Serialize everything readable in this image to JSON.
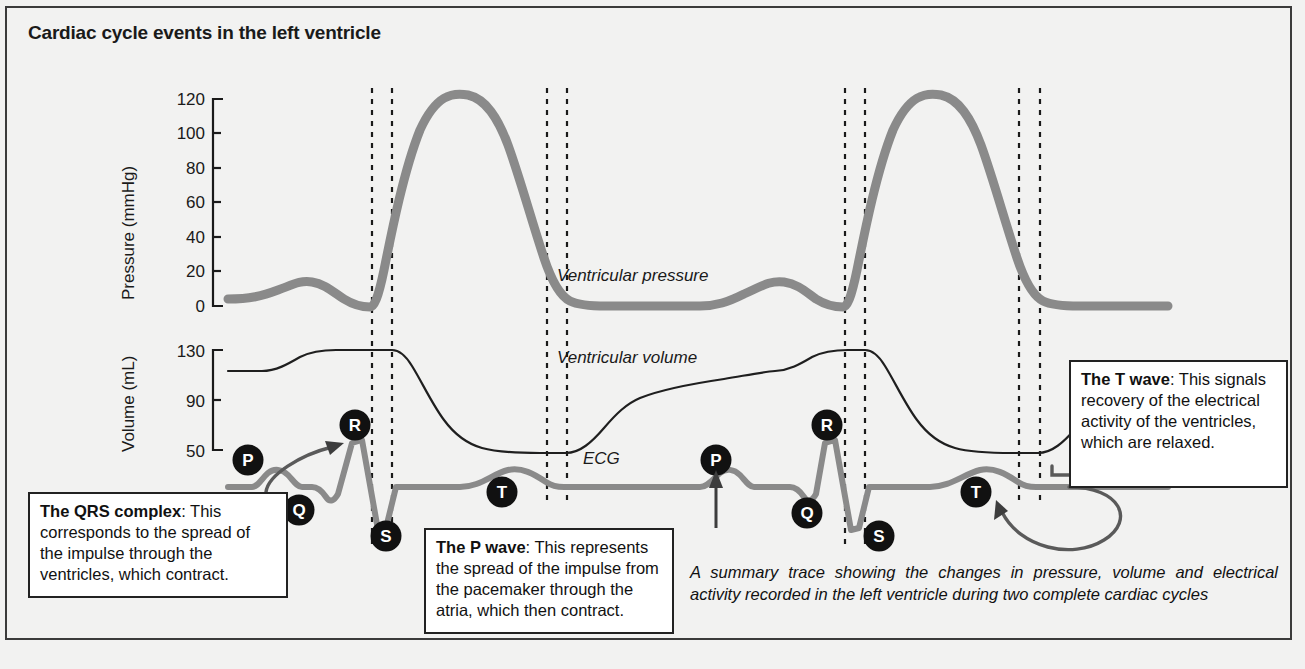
{
  "title": "Cardiac cycle events in the left ventricle",
  "axes": {
    "pressure": {
      "label": "Pressure  (mmHg)",
      "ticks": [
        "120",
        "100",
        "80",
        "60",
        "40",
        "20",
        "0"
      ],
      "unit": "mmHg",
      "min": 0,
      "max": 120
    },
    "volume": {
      "label": "Volume (mL)",
      "ticks": [
        "130",
        "90",
        "50"
      ],
      "unit": "mL",
      "min": 50,
      "max": 130
    }
  },
  "trace_labels": {
    "pressure": "Ventricular pressure",
    "volume": "Ventricular volume",
    "ecg": "ECG"
  },
  "ecg_markers": [
    {
      "letter": "P",
      "cx": 248,
      "cy": 460
    },
    {
      "letter": "Q",
      "cx": 299,
      "cy": 510
    },
    {
      "letter": "R",
      "cx": 355,
      "cy": 425
    },
    {
      "letter": "S",
      "cx": 386,
      "cy": 536
    },
    {
      "letter": "T",
      "cx": 502,
      "cy": 492
    },
    {
      "letter": "P",
      "cx": 716,
      "cy": 460
    },
    {
      "letter": "Q",
      "cx": 807,
      "cy": 513
    },
    {
      "letter": "R",
      "cx": 827,
      "cy": 425
    },
    {
      "letter": "S",
      "cx": 879,
      "cy": 536
    },
    {
      "letter": "T",
      "cx": 976,
      "cy": 492
    }
  ],
  "callouts": {
    "qrs": {
      "bold": "The QRS complex",
      "text": ": This corresponds to the spread of the impulse through the ventricles, which contract."
    },
    "p_wave": {
      "bold": "The P wave",
      "text": ": This represents the spread of the impulse from the pacemaker through the atria, which then contract."
    },
    "t_wave": {
      "bold": "The T wave",
      "text": ": This signals recovery of the electrical activity of the ventricles, which are relaxed."
    }
  },
  "caption": "A summary trace showing the changes in pressure, volume and electrical activity recorded in the left ventricle during two complete cardiac cycles",
  "colors": {
    "background": "#f2f2f1",
    "frame": "#3b3b3b",
    "pressure_trace": "#8a8a8a",
    "ecg_trace": "#8a8a8a",
    "volume_trace": "#2b2b2b",
    "text": "#111111",
    "marker_fill": "#111111",
    "marker_text": "#ffffff"
  },
  "chart_data": {
    "type": "line",
    "title": "Cardiac cycle events in the left ventricle",
    "xlabel": "",
    "grid": false,
    "legend": "inline-labels",
    "cycles": 2,
    "event_lines_note": "Dashed vertical lines mark valve events bounding isovolumetric contraction and relaxation in each cycle",
    "series": [
      {
        "name": "Ventricular pressure",
        "ylabel": "Pressure  (mmHg)",
        "ylim": [
          0,
          120
        ],
        "yticks": [
          0,
          20,
          40,
          60,
          80,
          100,
          120
        ],
        "values_mmHg": [
          5,
          6,
          8,
          10,
          9,
          6,
          5,
          8,
          75,
          110,
          122,
          124,
          120,
          108,
          88,
          60,
          30,
          6,
          4,
          4,
          5,
          6,
          8,
          10,
          9,
          6,
          5,
          8,
          75,
          110,
          122,
          124,
          120,
          108,
          88,
          60,
          30,
          6,
          4,
          4
        ]
      },
      {
        "name": "Ventricular volume",
        "ylabel": "Volume (mL)",
        "ylim": [
          50,
          130
        ],
        "yticks": [
          50,
          90,
          130
        ],
        "values_mL": [
          113,
          114,
          120,
          128,
          130,
          130,
          130,
          130,
          128,
          112,
          90,
          70,
          58,
          52,
          50,
          50,
          50,
          52,
          62,
          80,
          95,
          105,
          110,
          113,
          120,
          128,
          130,
          130,
          130,
          130,
          128,
          112,
          90,
          70,
          58,
          52,
          50,
          50,
          50,
          52
        ]
      },
      {
        "name": "ECG",
        "ylabel": "",
        "waves": [
          "P",
          "Q",
          "R",
          "S",
          "T"
        ],
        "note": "Two complete PQRST complexes shown"
      }
    ]
  }
}
